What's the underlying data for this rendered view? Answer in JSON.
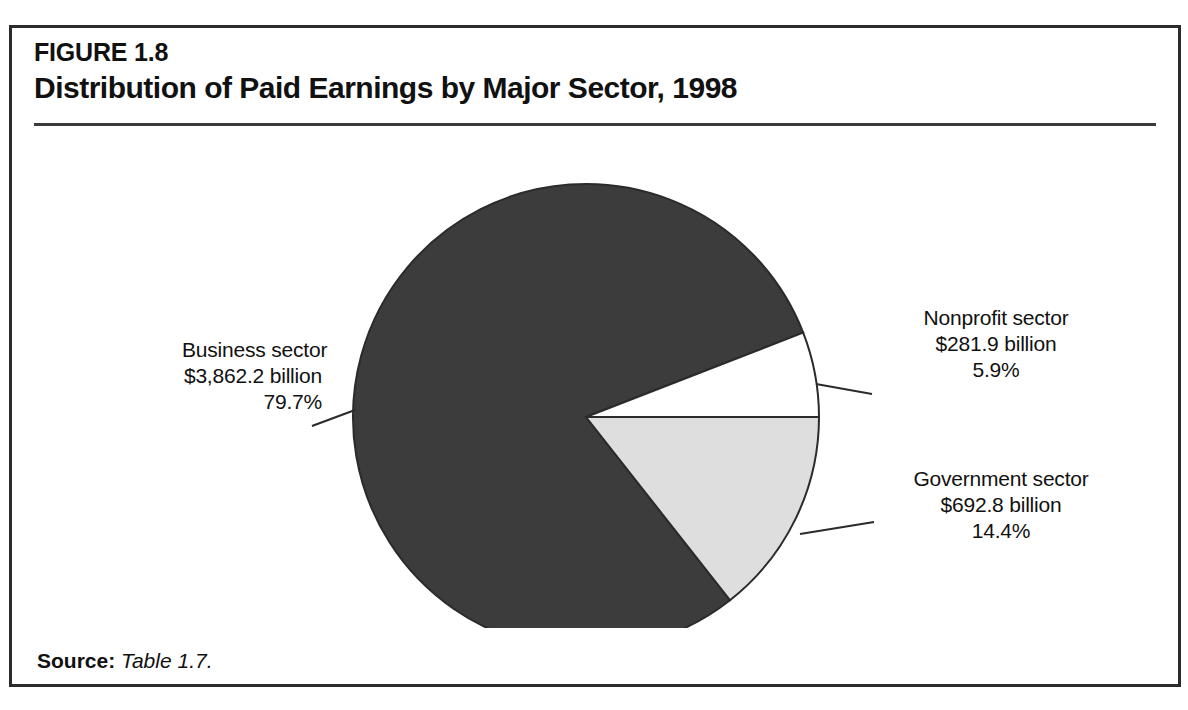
{
  "figure": {
    "number": "FIGURE 1.8",
    "title": "Distribution of Paid Earnings by Major Sector, 1998",
    "source_label": "Source:",
    "source_value": "Table 1.7."
  },
  "chart_data": {
    "type": "pie",
    "title": "Distribution of Paid Earnings by Major Sector, 1998",
    "unit": "billions of dollars",
    "year": "1998",
    "categories": [
      "Business sector",
      "Government sector",
      "Nonprofit sector"
    ],
    "values": [
      3862.2,
      692.8,
      281.9
    ],
    "percentages": [
      79.7,
      14.4,
      5.9
    ],
    "total": 4836.9,
    "legend_position": "callout-labels",
    "grid": false,
    "slices": [
      {
        "name": "Business sector",
        "value": 3862.2,
        "value_label": "$3,862.2 billion",
        "percent": 79.7,
        "percent_label": "79.7%",
        "color": "#3c3c3c",
        "start_angle": 51.84,
        "end_angle": 338.76
      },
      {
        "name": "Nonprofit sector",
        "value": 281.9,
        "value_label": "$281.9 billion",
        "percent": 5.9,
        "percent_label": "5.9%",
        "color": "#ffffff",
        "start_angle": 338.76,
        "end_angle": 360.0
      },
      {
        "name": "Government sector",
        "value": 692.8,
        "value_label": "$692.8 billion",
        "percent": 14.4,
        "percent_label": "14.4%",
        "color": "#dedede",
        "start_angle": 0.0,
        "end_angle": 51.84
      }
    ]
  },
  "callouts": {
    "business": {
      "name": "Business sector",
      "value": "$3,862.2 billion",
      "percent": "79.7%"
    },
    "nonprofit": {
      "name": "Nonprofit sector",
      "value": "$281.9 billion",
      "percent": "5.9%"
    },
    "government": {
      "name": "Government sector",
      "value": "$692.8 billion",
      "percent": "14.4%"
    }
  },
  "colors": {
    "business_slice": "#3c3c3c",
    "nonprofit_slice": "#ffffff",
    "government_slice": "#dedede",
    "outline": "#2b2b2b",
    "frame": "#2b2b2b",
    "text": "#111111"
  }
}
